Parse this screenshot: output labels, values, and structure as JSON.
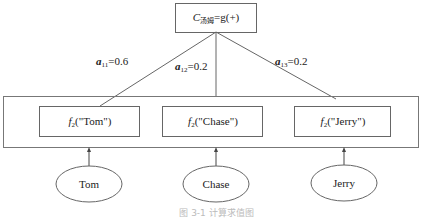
{
  "diagram": {
    "root": {
      "symbol": "C",
      "subscript": "汤姆",
      "expression": "=g(+)"
    },
    "weights": [
      {
        "symbol": "a",
        "subscript": "11",
        "value": "=0.6"
      },
      {
        "symbol": "a",
        "subscript": "12",
        "value": "=0.2"
      },
      {
        "symbol": "a",
        "subscript": "13",
        "value": "=0.2"
      }
    ],
    "functions": [
      {
        "symbol": "f",
        "subscript": "2",
        "arg": "(\"Tom\")"
      },
      {
        "symbol": "f",
        "subscript": "2",
        "arg": "(\"Chase\")"
      },
      {
        "symbol": "f",
        "subscript": "2",
        "arg": "(\"Jerry\")"
      }
    ],
    "inputs": [
      "Tom",
      "Chase",
      "Jerry"
    ],
    "caption": "图 3-1  计算求值图"
  }
}
